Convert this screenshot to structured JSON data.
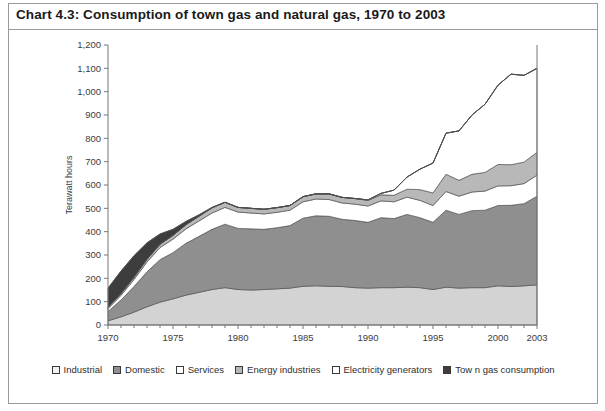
{
  "title": "Chart 4.3:  Consumption of town gas and natural gas, 1970 to 2003",
  "legend": {
    "items": [
      {
        "label": "Industrial",
        "color": "#f2f2f2",
        "swatch_name": "legend-swatch-industrial"
      },
      {
        "label": "Domestic",
        "color": "#8f8f8f",
        "swatch_name": "legend-swatch-domestic"
      },
      {
        "label": "Services",
        "color": "#ffffff",
        "swatch_name": "legend-swatch-services"
      },
      {
        "label": "Energy industries",
        "color": "#b8b8b8",
        "swatch_name": "legend-swatch-energy-industries"
      },
      {
        "label": "Electricity generators",
        "color": "#ffffff",
        "swatch_name": "legend-swatch-electricity-generators"
      },
      {
        "label": "Tow n gas consumption",
        "color": "#3d3d3d",
        "swatch_name": "legend-swatch-town-gas-consumption"
      }
    ]
  },
  "chart_data": {
    "type": "area",
    "stacked": true,
    "title": "Chart 4.3:  Consumption of town gas and natural gas, 1970 to 2003",
    "xlabel": "",
    "ylabel": "Terawatt hours",
    "ylim": [
      0,
      1200
    ],
    "ytick_step": 100,
    "yticks": [
      "0",
      "100",
      "200",
      "300",
      "400",
      "500",
      "600",
      "700",
      "800",
      "900",
      "1,000",
      "1,100",
      "1,200"
    ],
    "xlim": [
      1970,
      2003
    ],
    "xticks": [
      1970,
      1975,
      1980,
      1985,
      1990,
      1995,
      2000,
      2003
    ],
    "xtick_labels": [
      "1970",
      "1975",
      "1980",
      "1985",
      "1990",
      "1995",
      "2000",
      "2003"
    ],
    "grid": false,
    "legend_position": "bottom",
    "x": [
      1970,
      1971,
      1972,
      1973,
      1974,
      1975,
      1976,
      1977,
      1978,
      1979,
      1980,
      1981,
      1982,
      1983,
      1984,
      1985,
      1986,
      1987,
      1988,
      1989,
      1990,
      1991,
      1992,
      1993,
      1994,
      1995,
      1996,
      1997,
      1998,
      1999,
      2000,
      2001,
      2002,
      2003
    ],
    "series": [
      {
        "name": "Industrial",
        "color": "#d3d3d3",
        "values": [
          18,
          35,
          55,
          78,
          98,
          112,
          128,
          140,
          152,
          160,
          152,
          150,
          152,
          155,
          158,
          166,
          168,
          166,
          165,
          160,
          158,
          160,
          160,
          162,
          160,
          152,
          162,
          158,
          160,
          160,
          168,
          165,
          168,
          172
        ]
      },
      {
        "name": "Domestic",
        "color": "#8f8f8f",
        "values": [
          40,
          72,
          110,
          150,
          182,
          198,
          222,
          240,
          258,
          272,
          262,
          262,
          258,
          262,
          268,
          292,
          300,
          300,
          288,
          288,
          282,
          300,
          296,
          312,
          300,
          288,
          330,
          316,
          330,
          332,
          344,
          348,
          352,
          380
        ]
      },
      {
        "name": "Services",
        "color": "#ffffff",
        "values": [
          12,
          20,
          30,
          42,
          52,
          58,
          62,
          66,
          70,
          72,
          70,
          68,
          66,
          66,
          66,
          70,
          72,
          72,
          70,
          70,
          70,
          72,
          72,
          74,
          74,
          72,
          80,
          78,
          80,
          82,
          84,
          84,
          86,
          90
        ]
      },
      {
        "name": "Energy industries",
        "color": "#b8b8b8",
        "values": [
          6,
          8,
          10,
          12,
          14,
          16,
          18,
          20,
          22,
          22,
          20,
          20,
          20,
          20,
          20,
          22,
          22,
          24,
          24,
          24,
          24,
          26,
          28,
          34,
          46,
          54,
          74,
          68,
          76,
          80,
          92,
          90,
          92,
          98
        ]
      },
      {
        "name": "Electricity generators",
        "color": "#ffffff",
        "values": [
          0,
          0,
          0,
          0,
          0,
          0,
          0,
          0,
          0,
          0,
          0,
          0,
          0,
          0,
          0,
          0,
          0,
          0,
          0,
          0,
          2,
          6,
          22,
          52,
          88,
          128,
          176,
          212,
          254,
          292,
          340,
          388,
          372,
          360
        ]
      },
      {
        "name": "Tow n gas consumption",
        "color": "#3d3d3d",
        "values": [
          82,
          96,
          92,
          70,
          44,
          26,
          14,
          6,
          2,
          0,
          0,
          0,
          0,
          0,
          0,
          0,
          0,
          0,
          0,
          0,
          0,
          0,
          0,
          0,
          0,
          0,
          0,
          0,
          0,
          0,
          0,
          0,
          0,
          0
        ]
      }
    ],
    "totals": [
      158,
      231,
      297,
      352,
      390,
      410,
      444,
      472,
      504,
      526,
      504,
      500,
      496,
      503,
      512,
      550,
      562,
      562,
      547,
      542,
      536,
      564,
      578,
      634,
      668,
      694,
      822,
      832,
      900,
      946,
      1028,
      1075,
      1070,
      1100
    ]
  }
}
